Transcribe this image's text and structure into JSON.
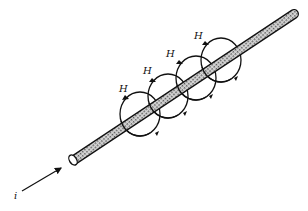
{
  "diagram": {
    "current_label": "i",
    "field_labels": [
      "H",
      "H",
      "H",
      "H"
    ],
    "colors": {
      "ink": "#111111",
      "wire_fill": "#9a9a9a",
      "background": "#ffffff"
    }
  }
}
